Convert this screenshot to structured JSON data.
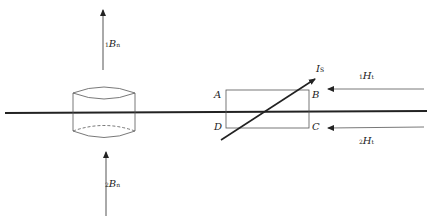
{
  "diagram": {
    "labels": {
      "b_top": {
        "pre": "1",
        "main": "B",
        "post": "n"
      },
      "b_bottom": {
        "pre": "2",
        "main": "B",
        "post": "n"
      },
      "current": {
        "main": "I",
        "post": "S"
      },
      "h_top": {
        "pre": "1",
        "main": "H",
        "post": "t"
      },
      "h_bottom": {
        "pre": "2",
        "main": "H",
        "post": "t"
      },
      "corner_a": "A",
      "corner_b": "B",
      "corner_c": "C",
      "corner_d": "D"
    },
    "colors": {
      "line": "#222222",
      "thin": "#555555"
    }
  }
}
